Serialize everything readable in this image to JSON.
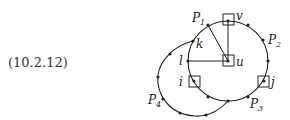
{
  "equation_label": "(10.2.12)",
  "nodes": {
    "v": "v",
    "u": "u",
    "l": "l",
    "k": "k",
    "i": "i",
    "j": "j"
  },
  "paths": {
    "p1": {
      "base": "P",
      "sub": "1"
    },
    "p2": {
      "base": "P",
      "sub": "2"
    },
    "p3": {
      "base": "P",
      "sub": "3"
    },
    "p4": {
      "base": "P",
      "sub": "4"
    }
  }
}
